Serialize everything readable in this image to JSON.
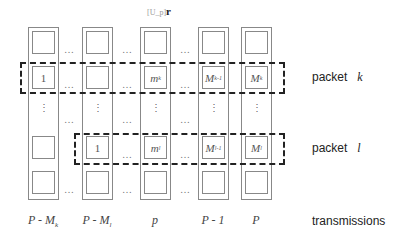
{
  "top_label": {
    "text": "[U_p]",
    "subscript": "r"
  },
  "columns": [
    {
      "id": "c1",
      "x": 28,
      "label_main": "P - M",
      "label_sub": "k",
      "cells": [
        "",
        "1",
        "",
        ""
      ]
    },
    {
      "id": "c2",
      "x": 82,
      "label_main": "P - M",
      "label_sub": "l",
      "cells": [
        "",
        "",
        "1",
        ""
      ]
    },
    {
      "id": "c3",
      "x": 140,
      "label_main": "p",
      "label_sub": "",
      "cells": [
        "",
        "m_k",
        "m_l",
        ""
      ]
    },
    {
      "id": "c4",
      "x": 198,
      "label_main": "P - 1",
      "label_sub": "",
      "cells": [
        "",
        "M_{k-1}",
        "M_{l-1}",
        ""
      ]
    },
    {
      "id": "c5",
      "x": 241,
      "label_main": "P",
      "label_sub": "",
      "cells": [
        "",
        "M_k",
        "M_l",
        ""
      ]
    }
  ],
  "cells_display": {
    "c1r2": "1",
    "c2r3": "1",
    "c3r2_main": "m",
    "c3r2_sub": "k",
    "c3r3_main": "m",
    "c3r3_sub": "l",
    "c4r2_main": "M",
    "c4r2_sub": "k-1",
    "c4r3_main": "M",
    "c4r3_sub": "l-1",
    "c5r2_main": "M",
    "c5r2_sub": "k",
    "c5r3_main": "M",
    "c5r3_sub": "l"
  },
  "ellipsis": "…",
  "vellipsis": "⋮",
  "right_labels": {
    "packet_k": {
      "text": "packet",
      "var": "k"
    },
    "packet_l": {
      "text": "packet",
      "var": "l"
    },
    "transmissions": "transmissions"
  },
  "bottom_labels": {
    "c1_main": "P - M",
    "c1_sub": "k",
    "c2_main": "P - M",
    "c2_sub": "l",
    "c3": "p",
    "c4": "P - 1",
    "c5": "P"
  }
}
